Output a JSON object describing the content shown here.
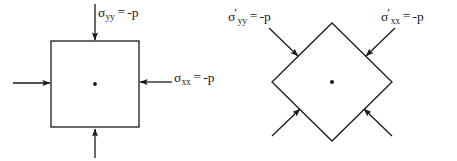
{
  "figure": {
    "background_color": "#ffffff",
    "stroke_color": "#1a1a1a",
    "text_color": "#1a1a1a",
    "width": 457,
    "height": 161
  },
  "left_diagram": {
    "name": "axis-aligned-square-element",
    "shape": "square",
    "center_dot": true,
    "square": {
      "left": 51,
      "top": 41,
      "right": 139,
      "bottom": 127
    },
    "center": {
      "x": 95,
      "y": 84
    },
    "arrows": [
      {
        "name": "top-arrow",
        "direction": "down",
        "points_inward": true
      },
      {
        "name": "bottom-arrow",
        "direction": "up",
        "points_inward": true
      },
      {
        "name": "left-arrow",
        "direction": "right",
        "points_inward": true
      },
      {
        "name": "right-arrow",
        "direction": "left",
        "points_inward": true
      }
    ],
    "labels": {
      "sigma_yy": {
        "symbol": "σ",
        "prime": "",
        "subscript": "yy",
        "equals": "=",
        "value": "-p"
      },
      "sigma_xx": {
        "symbol": "σ",
        "prime": "",
        "subscript": "xx",
        "equals": "=",
        "value": "-p"
      }
    }
  },
  "right_diagram": {
    "name": "rotated-diamond-element",
    "shape": "diamond",
    "center_dot": true,
    "vertices": {
      "top": {
        "x": 332,
        "y": 23
      },
      "right": {
        "x": 392,
        "y": 82
      },
      "bottom": {
        "x": 332,
        "y": 141
      },
      "left": {
        "x": 272,
        "y": 82
      }
    },
    "center": {
      "x": 332,
      "y": 82
    },
    "arrows": [
      {
        "name": "upper-left-arrow",
        "direction": "down-right",
        "points_inward": true
      },
      {
        "name": "upper-right-arrow",
        "direction": "down-left",
        "points_inward": true
      },
      {
        "name": "lower-left-arrow",
        "direction": "up-right",
        "points_inward": true
      },
      {
        "name": "lower-right-arrow",
        "direction": "up-left",
        "points_inward": true
      }
    ],
    "labels": {
      "sigma_yy_prime": {
        "symbol": "σ",
        "prime": "'",
        "subscript": "yy",
        "equals": "=",
        "value": "-p"
      },
      "sigma_xx_prime": {
        "symbol": "σ",
        "prime": "'",
        "subscript": "xx",
        "equals": "=",
        "value": "-p"
      }
    }
  }
}
